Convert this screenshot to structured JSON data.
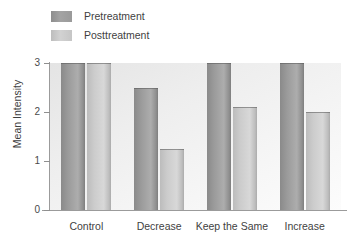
{
  "chart_data": {
    "type": "bar",
    "title": "",
    "xlabel": "",
    "ylabel": "Mean Intensity",
    "categories": [
      "Control",
      "Decrease",
      "Keep the Same",
      "Increase"
    ],
    "series": [
      {
        "name": "Pretreatment",
        "values": [
          3.0,
          2.5,
          3.0,
          3.0
        ]
      },
      {
        "name": "Posttreatment",
        "values": [
          3.0,
          1.25,
          2.1,
          2.0
        ]
      }
    ],
    "ylim": [
      0,
      3
    ],
    "yticks": [
      0,
      1,
      2,
      3
    ],
    "ytick_labels": [
      "0",
      "1",
      "2",
      "3"
    ],
    "grid": false,
    "legend_position": "top-left",
    "colors": {
      "pretreatment": "#9b9b9b",
      "posttreatment": "#cccccc",
      "plot_background": "#efefef",
      "axis": "#9b9b9b",
      "text": "#3f3f3f"
    }
  },
  "legend": {
    "items": [
      {
        "label": "Pretreatment",
        "swatch": "pre"
      },
      {
        "label": "Posttreatment",
        "swatch": "post"
      }
    ]
  },
  "axis": {
    "y_label": "Mean Intensity",
    "y_ticks": [
      "3",
      "2",
      "1",
      "0"
    ]
  }
}
